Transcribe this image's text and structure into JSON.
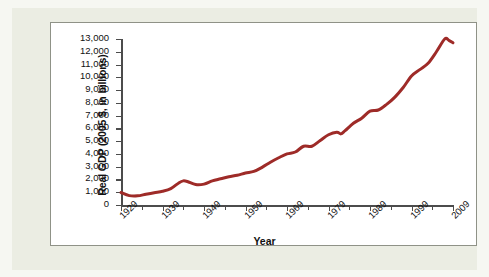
{
  "figure": {
    "background_color": "#ebede3",
    "card_background": "#ffffff",
    "card_border_color": "#8f9287"
  },
  "chart_data": {
    "type": "line",
    "title": "",
    "xlabel": "Year",
    "ylabel": "Real GDP (2005 $, in billions)",
    "xlim": [
      1929,
      2009
    ],
    "ylim": [
      0,
      13000
    ],
    "grid": false,
    "legend": null,
    "line_color": "#9e2b28",
    "line_width": 3,
    "x_tick_labels": [
      "1929",
      "1939",
      "1949",
      "1959",
      "1969",
      "1979",
      "1989",
      "1999",
      "2009"
    ],
    "x_major_ticks": [
      1929,
      1939,
      1949,
      1959,
      1969,
      1979,
      1989,
      1999,
      2009
    ],
    "x_minor_ticks": [
      1934,
      1944,
      1954,
      1964,
      1974,
      1984,
      1994,
      2004
    ],
    "y_tick_labels": [
      "0",
      "1,000",
      "2,000",
      "3,000",
      "4,000",
      "5,000",
      "6,000",
      "7,000",
      "8,000",
      "9,000",
      "10,000",
      "11,000",
      "12,000",
      "13,000"
    ],
    "y_ticks": [
      0,
      1000,
      2000,
      3000,
      4000,
      5000,
      6000,
      7000,
      8000,
      9000,
      10000,
      11000,
      12000,
      13000
    ],
    "x": [
      1929,
      1931,
      1933,
      1935,
      1937,
      1939,
      1941,
      1943,
      1944,
      1945,
      1947,
      1949,
      1951,
      1953,
      1955,
      1957,
      1959,
      1961,
      1963,
      1965,
      1967,
      1969,
      1971,
      1973,
      1975,
      1977,
      1979,
      1981,
      1982,
      1983,
      1985,
      1987,
      1989,
      1991,
      1993,
      1995,
      1997,
      1999,
      2001,
      2003,
      2005,
      2007,
      2008,
      2009
    ],
    "y": [
      977,
      735,
      716,
      847,
      967,
      1073,
      1277,
      1750,
      1890,
      1840,
      1600,
      1635,
      1890,
      2050,
      2213,
      2330,
      2505,
      2630,
      2950,
      3350,
      3700,
      4000,
      4150,
      4600,
      4600,
      5050,
      5500,
      5700,
      5570,
      5820,
      6400,
      6800,
      7350,
      7440,
      7880,
      8450,
      9200,
      10100,
      10600,
      11100,
      12000,
      13000,
      12900,
      12700
    ],
    "annotations": []
  }
}
